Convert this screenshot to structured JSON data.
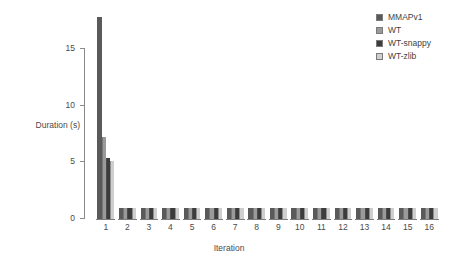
{
  "chart_data": {
    "type": "bar",
    "title": "",
    "xlabel": "Iteration",
    "ylabel": "Duration (s)",
    "categories": [
      "1",
      "2",
      "3",
      "4",
      "5",
      "6",
      "7",
      "8",
      "9",
      "10",
      "11",
      "12",
      "13",
      "14",
      "15",
      "16"
    ],
    "ylim": [
      0,
      18.5
    ],
    "yticks": [
      0,
      5,
      10,
      15
    ],
    "ytick_labels": [
      "0",
      "5",
      "10",
      "15"
    ],
    "grid": false,
    "legend_position": "top-right",
    "series": [
      {
        "name": "MMAPv1",
        "color": "#5a5a5a",
        "values": [
          17.8,
          1.0,
          1.0,
          1.0,
          1.0,
          1.0,
          1.0,
          1.0,
          1.0,
          1.0,
          1.0,
          1.0,
          1.0,
          1.0,
          1.0,
          1.0
        ]
      },
      {
        "name": "WT",
        "color": "#9a9a9a",
        "values": [
          7.2,
          1.0,
          1.0,
          1.0,
          1.0,
          1.0,
          1.0,
          1.0,
          1.0,
          1.0,
          1.0,
          1.0,
          1.0,
          1.0,
          1.0,
          1.0
        ]
      },
      {
        "name": "WT-snappy",
        "color": "#3c3c3c",
        "values": [
          5.4,
          1.0,
          1.0,
          1.0,
          1.0,
          1.0,
          1.0,
          1.0,
          1.0,
          1.0,
          1.0,
          1.0,
          1.0,
          1.0,
          1.0,
          1.0
        ]
      },
      {
        "name": "WT-zlib",
        "color": "#cfcfcf",
        "values": [
          5.1,
          1.0,
          1.0,
          1.0,
          1.0,
          1.0,
          1.0,
          1.0,
          1.0,
          1.0,
          1.0,
          1.0,
          1.0,
          1.0,
          1.0,
          1.0
        ]
      }
    ]
  },
  "legend": {
    "items": [
      {
        "label": "MMAPv1"
      },
      {
        "label": "WT"
      },
      {
        "label": "WT-snappy"
      },
      {
        "label": "WT-zlib"
      }
    ]
  },
  "axes": {
    "y_title": "Duration (s)",
    "x_title": "Iteration"
  }
}
